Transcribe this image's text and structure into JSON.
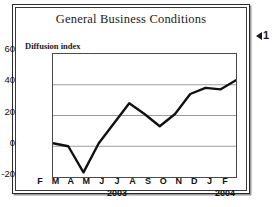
{
  "chart_data": {
    "type": "line",
    "title": "General Business Conditions",
    "ylabel": "Diffusion index",
    "xlabel": "",
    "categories": [
      "F",
      "M",
      "A",
      "M",
      "J",
      "J",
      "A",
      "S",
      "O",
      "N",
      "D",
      "J",
      "F"
    ],
    "values": [
      2,
      0,
      -17,
      2,
      15,
      28,
      21,
      13,
      21,
      34,
      38,
      37,
      43
    ],
    "year_labels": [
      {
        "text": "2003",
        "at_category_index": 5
      },
      {
        "text": "2004",
        "at_category_index": 12
      }
    ],
    "yticks": [
      60,
      40,
      20,
      0,
      -20
    ],
    "ytick_labels": [
      "60",
      "40",
      "20",
      "0",
      "-20"
    ],
    "ylim": [
      -20,
      60
    ],
    "grid": true,
    "legend": null,
    "series": [
      {
        "name": "Diffusion index",
        "values": [
          2,
          0,
          -17,
          2,
          15,
          28,
          21,
          13,
          21,
          34,
          38,
          37,
          43
        ]
      }
    ]
  },
  "colors": {
    "line": "#111111",
    "grid": "#9a9a9a",
    "frame": "#3a3a3a",
    "text": "#1a1a1a",
    "background": "#ffffff"
  },
  "marker": {
    "number": "1"
  }
}
